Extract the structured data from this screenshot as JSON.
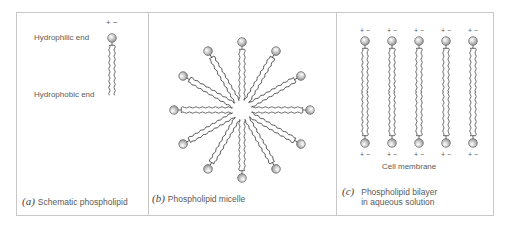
{
  "figure": {
    "panels": [
      {
        "id": "a",
        "letter": "(a)",
        "caption": "Schematic phospholipid",
        "labels": {
          "head": "Hydrophilic end",
          "tail": "Hydrophobic end"
        },
        "charge": "+ −"
      },
      {
        "id": "b",
        "letter": "(b)",
        "caption": "Phospholipid micelle",
        "molecule_count": 12
      },
      {
        "id": "c",
        "letter": "(c)",
        "caption_line1": "Phospholipid bilayer",
        "caption_line2": "in aqueous solution",
        "sublabel": "Cell membrane",
        "column_count": 5,
        "charge": "+ −"
      }
    ],
    "colors": {
      "border": "#c8c8c8",
      "head_fill": "#bdbdbd",
      "head_stroke": "#6e6e6e",
      "tail_stroke": "#444444",
      "text": "#5a5a5a"
    }
  }
}
